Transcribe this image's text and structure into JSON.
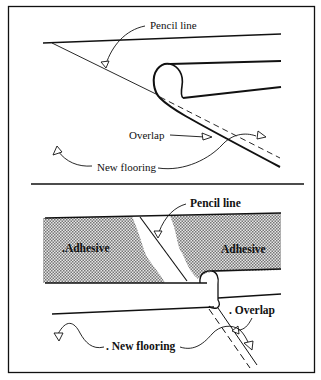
{
  "figure": {
    "panels": [
      {
        "id": "top",
        "labels": {
          "pencil_line": "Pencil line",
          "overlap": "Overlap",
          "new_flooring": "New flooring"
        }
      },
      {
        "id": "bottom",
        "labels": {
          "pencil_line": "Pencil line",
          "adhesive_left": "Adhesive",
          "adhesive_right": "Adhesive",
          "overlap": "Overlap",
          "new_flooring": "New flooring"
        }
      }
    ],
    "colors": {
      "ink": "#111111",
      "paper": "#ffffff",
      "adhesive_fill": "#bdbdbd"
    }
  }
}
